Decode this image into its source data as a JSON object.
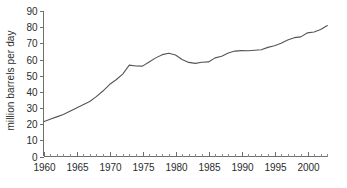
{
  "chart_data": {
    "type": "line",
    "title": "",
    "subtitle": "",
    "xlabel": "",
    "ylabel": "million barrels per day",
    "xlim": [
      1960,
      2003
    ],
    "ylim": [
      0,
      90
    ],
    "grid": false,
    "legend": null,
    "legend_position": "none",
    "line_color": "#555555",
    "axis_color": "#6e6e6e",
    "text_color": "#2b2b2b",
    "background_color": "#ffffff",
    "y_ticks": [
      0,
      10,
      20,
      30,
      40,
      50,
      60,
      70,
      80,
      90
    ],
    "y_tick_labels": [
      "0",
      "10",
      "20",
      "30",
      "40",
      "50",
      "60",
      "70",
      "80",
      "90"
    ],
    "x_ticks": [
      1960,
      1965,
      1970,
      1975,
      1980,
      1985,
      1990,
      1995,
      2000
    ],
    "x_tick_labels": [
      "1960",
      "1965",
      "1970",
      "1975",
      "1980",
      "1985",
      "1990",
      "1995",
      "2000"
    ],
    "x_minor_tick_interval": 1,
    "series": [
      {
        "name": "world oil production",
        "x": [
          1960,
          1961,
          1962,
          1963,
          1964,
          1965,
          1966,
          1967,
          1968,
          1969,
          1970,
          1971,
          1972,
          1973,
          1974,
          1975,
          1976,
          1977,
          1978,
          1979,
          1980,
          1981,
          1982,
          1983,
          1984,
          1985,
          1986,
          1987,
          1988,
          1989,
          1990,
          1991,
          1992,
          1993,
          1994,
          1995,
          1996,
          1997,
          1998,
          1999,
          2000,
          2001,
          2002,
          2003
        ],
        "values": [
          21.5,
          23.0,
          24.5,
          26.0,
          28.0,
          30.0,
          32.0,
          34.0,
          37.0,
          40.5,
          44.5,
          47.5,
          51.0,
          56.5,
          56.0,
          55.9,
          58.5,
          61.0,
          63.0,
          63.9,
          62.8,
          60.0,
          58.2,
          57.6,
          58.3,
          58.5,
          61.0,
          62.0,
          64.0,
          65.2,
          65.5,
          65.4,
          65.7,
          66.0,
          67.5,
          68.5,
          70.0,
          72.0,
          73.5,
          74.0,
          76.5,
          77.0,
          78.5,
          81.0
        ]
      }
    ],
    "annotations": []
  }
}
